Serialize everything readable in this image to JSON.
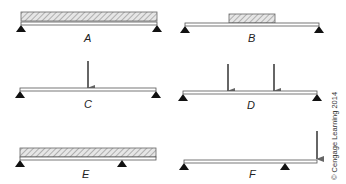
{
  "colors": {
    "beam_stroke": "#555555",
    "load_fill": "#d8d8d8",
    "hatch": "#888888",
    "arrow": "#666666",
    "support": "#111111"
  },
  "panels": [
    {
      "label": "A",
      "load": "uniform distributed load over full span",
      "supports": "simply supported at both ends"
    },
    {
      "label": "B",
      "load": "partial distributed load at mid-span",
      "supports": "simply supported at both ends"
    },
    {
      "label": "C",
      "load": "single concentrated load at mid-span",
      "supports": "simply supported at both ends"
    },
    {
      "label": "D",
      "load": "two concentrated loads",
      "supports": "simply supported at both ends"
    },
    {
      "label": "E",
      "load": "uniform distributed load over full length",
      "supports": "overhanging beam, one overhang"
    },
    {
      "label": "F",
      "load": "concentrated load at overhang tip",
      "supports": "overhanging beam, one overhang"
    }
  ],
  "credit": "© Cengage Learning 2014"
}
